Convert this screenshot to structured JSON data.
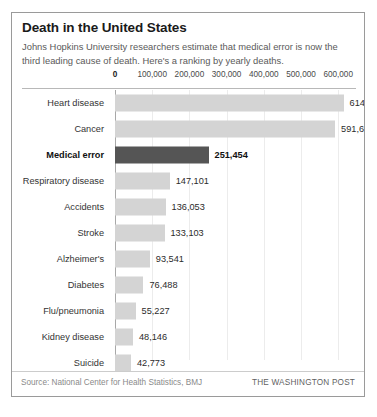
{
  "figure": {
    "title": "Death in the United States",
    "subtitle": "Johns Hopkins University researchers estimate that medical error is now the third leading cause of death. Here's a ranking by yearly deaths.",
    "source_note": "Source: National Center for Health Statistics, BMJ",
    "credit": "THE WASHINGTON POST"
  },
  "colors": {
    "bar_default": "#d4d4d4",
    "bar_highlight": "#555555",
    "border": "#9a9a9a",
    "gridline": "#ececec",
    "axis": "#a8a8a8"
  },
  "chart_data": {
    "type": "bar",
    "orientation": "horizontal",
    "title": "Death in the United States",
    "subtitle": "Johns Hopkins University researchers estimate that medical error is now the third leading cause of death. Here's a ranking by yearly deaths.",
    "xlabel": "",
    "ylabel": "",
    "xlim": [
      0,
      650000
    ],
    "grid": true,
    "legend": "none",
    "tick_labels": [
      "0",
      "100,000",
      "200,000",
      "300,000",
      "400,000",
      "500,000",
      "600,000"
    ],
    "ticks": [
      0,
      100000,
      200000,
      300000,
      400000,
      500000,
      600000
    ],
    "categories": [
      "Heart disease",
      "Cancer",
      "Medical error",
      "Respiratory disease",
      "Accidents",
      "Stroke",
      "Alzheimer's",
      "Diabetes",
      "Flu/pneumonia",
      "Kidney disease",
      "Suicide"
    ],
    "values": [
      614348,
      591699,
      251454,
      147101,
      136053,
      133103,
      93541,
      76488,
      55227,
      48146,
      42773
    ],
    "value_labels": [
      "614,348",
      "591,699",
      "251,454",
      "147,101",
      "136,053",
      "133,103",
      "93,541",
      "76,488",
      "55,227",
      "48,146",
      "42,773"
    ],
    "highlighted": [
      "Medical error"
    ]
  }
}
